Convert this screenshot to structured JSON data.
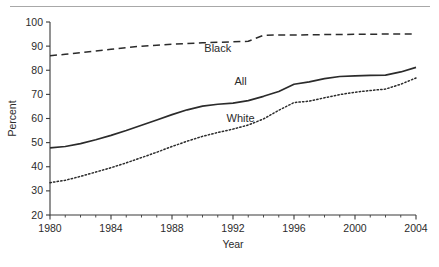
{
  "figure": {
    "background_color": "#ffffff",
    "rule_color": "#a8a8a8",
    "axis_color": "#3a3a3a",
    "ink_color": "#2b2b2b"
  },
  "axes": {
    "y_title": "Percent",
    "x_title": "Year"
  },
  "chart_data": {
    "type": "line",
    "title": "",
    "xlabel": "Year",
    "ylabel": "Percent",
    "xlim": [
      1980,
      2004
    ],
    "ylim": [
      20,
      100
    ],
    "xticks": [
      1980,
      1984,
      1988,
      1992,
      1996,
      2000,
      2004
    ],
    "xticklabels": [
      "1980",
      "1984",
      "1988",
      "1992",
      "1996",
      "2000",
      "2004"
    ],
    "xminorticks": [
      1981,
      1982,
      1983,
      1985,
      1986,
      1987,
      1989,
      1990,
      1991,
      1993,
      1994,
      1995,
      1997,
      1998,
      1999,
      2001,
      2002,
      2003
    ],
    "yticks": [
      20,
      30,
      40,
      50,
      60,
      70,
      80,
      90,
      100
    ],
    "yticklabels": [
      "20",
      "30",
      "40",
      "50",
      "60",
      "70",
      "80",
      "90",
      "100"
    ],
    "grid": false,
    "legend_position": "inline-annotations",
    "x": [
      1980,
      1981,
      1982,
      1983,
      1984,
      1985,
      1986,
      1987,
      1988,
      1989,
      1990,
      1991,
      1992,
      1993,
      1994,
      1995,
      1996,
      1997,
      1998,
      1999,
      2000,
      2001,
      2002,
      2003,
      2004
    ],
    "series": [
      {
        "name": "Black",
        "linestyle": "dashed",
        "label_text": "Black",
        "label_x": 1991.0,
        "label_y": 87.5,
        "values": [
          86.0,
          86.6,
          87.3,
          88.0,
          88.7,
          89.4,
          90.0,
          90.4,
          90.8,
          91.1,
          91.4,
          91.6,
          91.8,
          92.0,
          94.5,
          94.6,
          94.6,
          94.7,
          94.8,
          94.8,
          94.9,
          94.9,
          95.0,
          95.0,
          95.0
        ]
      },
      {
        "name": "All",
        "linestyle": "solid",
        "label_text": "All",
        "label_x": 1992.5,
        "label_y": 74.0,
        "values": [
          47.8,
          48.4,
          49.6,
          51.2,
          53.0,
          55.0,
          57.2,
          59.4,
          61.6,
          63.6,
          65.1,
          65.9,
          66.4,
          67.4,
          69.2,
          71.2,
          74.2,
          75.2,
          76.5,
          77.4,
          77.7,
          77.9,
          78.0,
          79.3,
          81.2
        ]
      },
      {
        "name": "White",
        "linestyle": "dotted",
        "label_text": "White",
        "label_x": 1992.5,
        "label_y": 58.5,
        "values": [
          33.4,
          34.4,
          36.0,
          37.8,
          39.6,
          41.6,
          43.8,
          46.0,
          48.4,
          50.6,
          52.6,
          54.2,
          55.6,
          57.3,
          59.8,
          63.4,
          66.6,
          67.2,
          68.6,
          69.9,
          70.9,
          71.6,
          72.2,
          74.2,
          76.8
        ]
      }
    ]
  }
}
